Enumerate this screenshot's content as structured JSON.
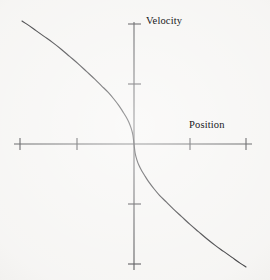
{
  "figure": {
    "type": "phase-plane-sketch",
    "background_color": "#f5f4f2",
    "ink_color": "#2b2b2e"
  },
  "axes": {
    "x_axis": {
      "label": "Position",
      "label_position": "above-right",
      "origin_px": 134,
      "y_px": 144,
      "start_px": 14,
      "end_px": 252,
      "ticks_px": [
        20,
        77,
        190,
        246
      ],
      "tick_labels": []
    },
    "y_axis": {
      "label": "Velocity",
      "label_position": "top-right",
      "origin_px": 144,
      "x_px": 134,
      "start_px": 22,
      "end_px": 270,
      "ticks_px": [
        24,
        84,
        204,
        264
      ],
      "tick_labels": []
    }
  },
  "chart_data": {
    "type": "line",
    "title": "",
    "subtitle": "",
    "xlabel": "Position",
    "ylabel": "Velocity",
    "grid": false,
    "legend": false,
    "xlim": [
      -2.1,
      2.1
    ],
    "ylim": [
      -2.2,
      2.2
    ],
    "xticks": [
      -2,
      -1,
      1,
      2
    ],
    "yticks": [
      2,
      1,
      -1,
      -2
    ],
    "xtick_labels": [
      "",
      "",
      "",
      ""
    ],
    "ytick_labels": [
      "",
      "",
      "",
      ""
    ],
    "series": [
      {
        "name": "trajectory",
        "description": "monotonically decreasing odd-symmetric curve through the origin, steep near x=0 and flattening outward",
        "color": "#2b2b2e",
        "x": [
          -2.0,
          -1.9,
          -1.75,
          -1.6,
          -1.45,
          -1.3,
          -1.15,
          -1.0,
          -0.85,
          -0.7,
          -0.58,
          -0.46,
          -0.36,
          -0.27,
          -0.2,
          -0.14,
          -0.09,
          -0.05,
          -0.02,
          0.0,
          0.02,
          0.05,
          0.09,
          0.14,
          0.2,
          0.27,
          0.36,
          0.46,
          0.58,
          0.7,
          0.85,
          1.0,
          1.15,
          1.3,
          1.45,
          1.6,
          1.75,
          1.9,
          2.0
        ],
        "y": [
          2.05,
          1.99,
          1.89,
          1.79,
          1.69,
          1.58,
          1.46,
          1.34,
          1.21,
          1.08,
          0.97,
          0.86,
          0.75,
          0.64,
          0.54,
          0.45,
          0.36,
          0.26,
          0.15,
          0.0,
          -0.15,
          -0.26,
          -0.36,
          -0.45,
          -0.54,
          -0.64,
          -0.75,
          -0.86,
          -0.97,
          -1.08,
          -1.21,
          -1.34,
          -1.46,
          -1.58,
          -1.69,
          -1.79,
          -1.89,
          -1.99,
          -2.05
        ]
      }
    ],
    "annotations": [
      {
        "text": "Velocity",
        "target": "y-axis"
      },
      {
        "text": "Position",
        "target": "x-axis"
      }
    ]
  },
  "labels": {
    "velocity": "Velocity",
    "position": "Position"
  }
}
